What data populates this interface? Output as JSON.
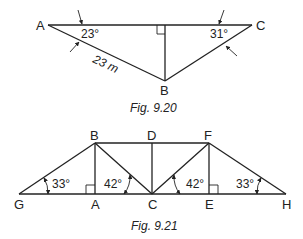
{
  "figure_1": {
    "caption": "Fig. 9.20",
    "points": {
      "A": "A",
      "B": "B",
      "C": "C"
    },
    "angle_A": "23°",
    "angle_C": "31°",
    "length_AB": "23 m"
  },
  "figure_2": {
    "caption": "Fig. 9.21",
    "points": {
      "A": "A",
      "B": "B",
      "C": "C",
      "D": "D",
      "E": "E",
      "F": "F",
      "G": "G",
      "H": "H"
    },
    "angle_G": "33°",
    "angle_BCA": "42°",
    "angle_FCE": "42°",
    "angle_H": "33°"
  }
}
